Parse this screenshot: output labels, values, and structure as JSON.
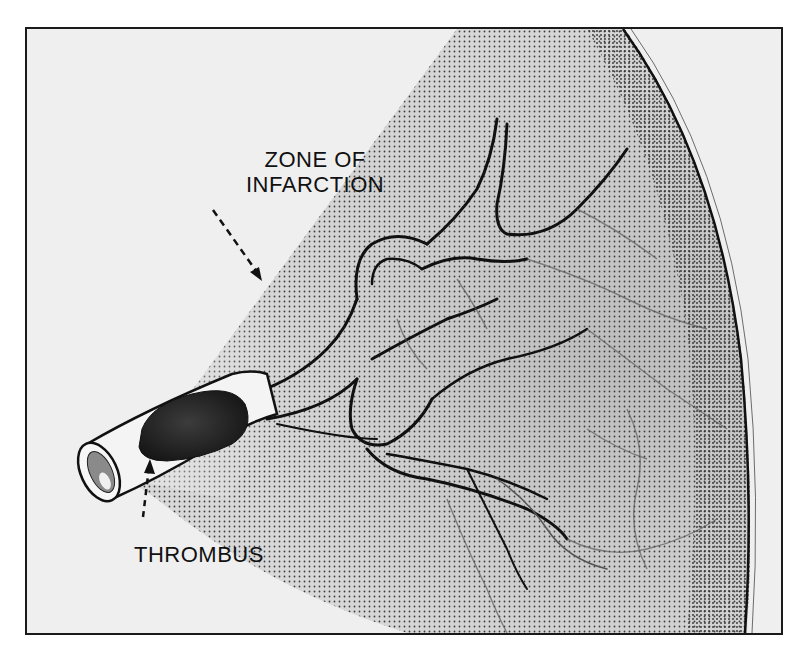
{
  "figure": {
    "labels": {
      "zone_line1": "ZONE OF",
      "zone_line2": "INFARCTION",
      "thrombus": "THROMBUS"
    },
    "arrows": [
      {
        "name": "zone-of-infarction-arrow",
        "style": "dashed",
        "points_to": "stippled infarct region"
      },
      {
        "name": "thrombus-arrow",
        "style": "dashed",
        "points_to": "thrombus inside artery"
      }
    ],
    "colors": {
      "background": "#efefef",
      "border": "#1a1a1a",
      "stipple": "#3a3a3a",
      "thrombus": "#2a2a2a",
      "vessel_outline": "#111111"
    }
  }
}
